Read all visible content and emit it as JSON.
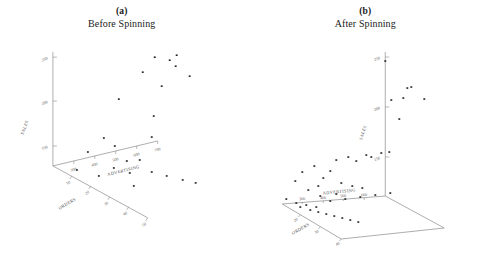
{
  "figure": {
    "panels": [
      {
        "tag": "(a)",
        "title": "Before Spinning",
        "vertical_axis": {
          "label": "SALES",
          "ticks": [
            "150",
            "200",
            "250"
          ]
        },
        "left_axis": {
          "label": "ORDERS",
          "ticks": [
            "10",
            "20",
            "30",
            "40",
            "50"
          ]
        },
        "right_axis": {
          "label": "ADVERTISING",
          "ticks": [
            "300",
            "400",
            "500",
            "600",
            "700"
          ]
        }
      },
      {
        "tag": "(b)",
        "title": "After Spinning",
        "vertical_axis": {
          "label": "SALES",
          "ticks": [
            "150",
            "200",
            "250"
          ]
        },
        "left_axis": {
          "label": "ORDERS",
          "ticks": [
            "10",
            "20",
            "30",
            "40",
            "50"
          ]
        },
        "right_axis": {
          "label": "ADVERTISING",
          "ticks": [
            "300",
            "400",
            "500",
            "600",
            "700"
          ]
        }
      }
    ]
  },
  "chart_data": [
    {
      "type": "scatter",
      "title": "Before Spinning",
      "subtitle": "(a)",
      "xlabel": "ORDERS",
      "ylabel": "ADVERTISING",
      "zlabel": "SALES",
      "grid": false,
      "legend": "none",
      "zlim": [
        130,
        265
      ],
      "projected_points": [
        [
          155,
          57
        ],
        [
          170,
          60
        ],
        [
          177,
          55
        ],
        [
          176,
          66
        ],
        [
          143,
          72
        ],
        [
          190,
          76
        ],
        [
          162,
          86
        ],
        [
          119,
          99
        ],
        [
          154,
          116
        ],
        [
          152,
          137
        ],
        [
          104,
          138
        ],
        [
          115,
          146
        ],
        [
          88,
          152
        ],
        [
          140,
          160
        ],
        [
          127,
          161
        ],
        [
          114,
          168
        ],
        [
          77,
          170
        ],
        [
          130,
          173
        ],
        [
          99,
          176
        ],
        [
          152,
          172
        ],
        [
          167,
          176
        ],
        [
          183,
          180
        ],
        [
          196,
          183
        ],
        [
          134,
          186
        ]
      ]
    },
    {
      "type": "scatter",
      "title": "After Spinning",
      "subtitle": "(b)",
      "xlabel": "ORDERS",
      "ylabel": "ADVERTISING",
      "zlabel": "SALES",
      "grid": false,
      "legend": "none",
      "zlim": [
        130,
        265
      ],
      "projected_points": [
        [
          407,
          88
        ],
        [
          411,
          87
        ],
        [
          403,
          98
        ],
        [
          424,
          99
        ],
        [
          391,
          100
        ],
        [
          399,
          119
        ],
        [
          385,
          61
        ],
        [
          295,
          181
        ],
        [
          302,
          172
        ],
        [
          314,
          166
        ],
        [
          323,
          178
        ],
        [
          330,
          171
        ],
        [
          336,
          160
        ],
        [
          348,
          157
        ],
        [
          356,
          161
        ],
        [
          366,
          155
        ],
        [
          371,
          157
        ],
        [
          381,
          153
        ],
        [
          389,
          152
        ],
        [
          318,
          186
        ],
        [
          308,
          190
        ],
        [
          341,
          183
        ],
        [
          352,
          186
        ],
        [
          362,
          188
        ]
      ],
      "floor_points": [
        [
          300,
          207
        ],
        [
          310,
          210
        ],
        [
          318,
          212
        ],
        [
          326,
          214
        ],
        [
          334,
          216
        ],
        [
          342,
          218
        ],
        [
          350,
          220
        ],
        [
          358,
          222
        ],
        [
          296,
          203
        ],
        [
          306,
          205
        ],
        [
          316,
          207
        ],
        [
          286,
          199
        ],
        [
          330,
          201
        ],
        [
          345,
          199
        ],
        [
          360,
          197
        ],
        [
          375,
          195
        ],
        [
          390,
          193
        ],
        [
          320,
          196
        ],
        [
          336,
          194
        ]
      ]
    }
  ]
}
